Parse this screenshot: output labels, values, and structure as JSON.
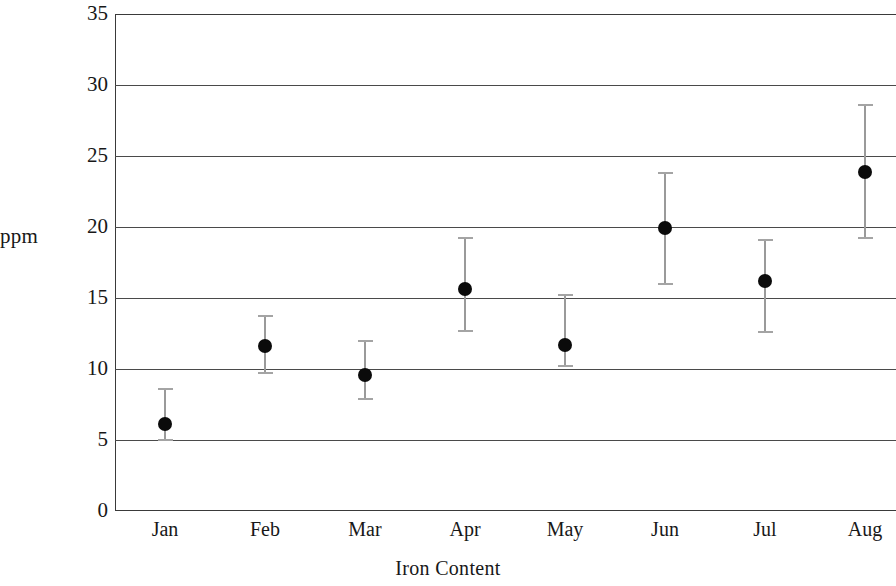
{
  "chart_data": {
    "type": "scatter",
    "title": "",
    "xlabel": "Iron Content",
    "ylabel": "ppm",
    "categories": [
      "Jan",
      "Feb",
      "Mar",
      "Apr",
      "May",
      "Jun",
      "Jul",
      "Aug"
    ],
    "values": [
      6.1,
      11.6,
      9.6,
      15.6,
      11.7,
      19.9,
      16.2,
      23.9
    ],
    "error_low": [
      5.0,
      9.7,
      7.9,
      12.7,
      10.2,
      16.0,
      12.6,
      19.2
    ],
    "error_high": [
      8.6,
      13.7,
      12.0,
      19.2,
      15.2,
      23.8,
      19.1,
      28.6
    ],
    "ylim": [
      0,
      35
    ],
    "ytick_labels": [
      "0",
      "5",
      "10",
      "15",
      "20",
      "25",
      "30",
      "35"
    ],
    "ytick_values": [
      0,
      5,
      10,
      15,
      20,
      25,
      30,
      35
    ],
    "grid": true,
    "grid_axis": "y",
    "legend": "none",
    "marker": "filled-circle",
    "error_bar_style": "capped-vertical",
    "note_cropped_right": "plot area extends past the right edge of the image",
    "colors": {
      "marker": "#0b0b0b",
      "error_bar": "#9a9a9a",
      "grid": "#4a4a4a",
      "frame": "#3a3a3a",
      "text": "#181818",
      "background": "#ffffff"
    }
  }
}
